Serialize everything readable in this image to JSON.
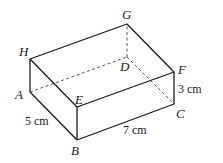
{
  "figure": {
    "type": "cuboid",
    "vertices": {
      "A": {
        "label": "A",
        "x": 30,
        "y": 92
      },
      "B": {
        "label": "B",
        "x": 77,
        "y": 140
      },
      "C": {
        "label": "C",
        "x": 174,
        "y": 104
      },
      "D": {
        "label": "D",
        "x": 127,
        "y": 57
      },
      "E": {
        "label": "E",
        "x": 77,
        "y": 107
      },
      "F": {
        "label": "F",
        "x": 174,
        "y": 72
      },
      "G": {
        "label": "G",
        "x": 127,
        "y": 24
      },
      "H": {
        "label": "H",
        "x": 30,
        "y": 59
      }
    },
    "dimensions": {
      "AB": "5 cm",
      "BC": "7 cm",
      "CF": "3 cm"
    }
  }
}
